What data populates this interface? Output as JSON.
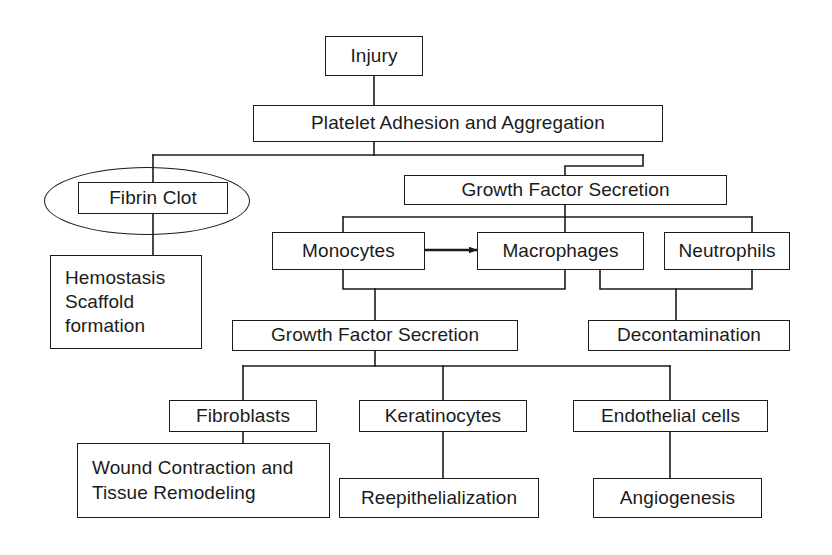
{
  "diagram": {
    "line_color": "#1b1b1b",
    "background": "#ffffff",
    "nodes": {
      "injury": "Injury",
      "platelet": "Platelet Adhesion and Aggregation",
      "fibrin_clot": "Fibrin Clot",
      "hemostasis": "Hemostasis\nScaffold\nformation",
      "growth_factor_1": "Growth Factor Secretion",
      "monocytes": "Monocytes",
      "macrophages": "Macrophages",
      "neutrophils": "Neutrophils",
      "growth_factor_2": "Growth Factor Secretion",
      "decontamination": "Decontamination",
      "fibroblasts": "Fibroblasts",
      "keratinocytes": "Keratinocytes",
      "endothelial": "Endothelial cells",
      "wound_contraction": "Wound Contraction and\nTissue Remodeling",
      "reepithelialization": "Reepithelialization",
      "angiogenesis": "Angiogenesis"
    },
    "highlight": {
      "shape": "ellipse",
      "encircles": "Fibrin Clot"
    },
    "edges": [
      {
        "from": "Injury",
        "to": "Platelet Adhesion and Aggregation",
        "style": "plain"
      },
      {
        "from": "Platelet Adhesion and Aggregation",
        "to": "Fibrin Clot",
        "style": "plain"
      },
      {
        "from": "Platelet Adhesion and Aggregation",
        "to": "Growth Factor Secretion",
        "style": "plain"
      },
      {
        "from": "Fibrin Clot",
        "to": "Hemostasis Scaffold formation",
        "style": "plain"
      },
      {
        "from": "Growth Factor Secretion",
        "to": "Monocytes",
        "style": "plain"
      },
      {
        "from": "Growth Factor Secretion",
        "to": "Macrophages",
        "style": "plain"
      },
      {
        "from": "Growth Factor Secretion",
        "to": "Neutrophils",
        "style": "plain"
      },
      {
        "from": "Monocytes",
        "to": "Macrophages",
        "style": "arrow"
      },
      {
        "from": "Monocytes",
        "to": "Growth Factor Secretion",
        "style": "plain"
      },
      {
        "from": "Macrophages",
        "to": "Growth Factor Secretion",
        "style": "plain"
      },
      {
        "from": "Macrophages",
        "to": "Decontamination",
        "style": "plain"
      },
      {
        "from": "Neutrophils",
        "to": "Decontamination",
        "style": "plain"
      },
      {
        "from": "Growth Factor Secretion",
        "to": "Fibroblasts",
        "style": "plain"
      },
      {
        "from": "Growth Factor Secretion",
        "to": "Keratinocytes",
        "style": "plain"
      },
      {
        "from": "Growth Factor Secretion",
        "to": "Endothelial cells",
        "style": "plain"
      },
      {
        "from": "Fibroblasts",
        "to": "Wound Contraction and Tissue Remodeling",
        "style": "plain"
      },
      {
        "from": "Keratinocytes",
        "to": "Reepithelialization",
        "style": "plain"
      },
      {
        "from": "Endothelial cells",
        "to": "Angiogenesis",
        "style": "plain"
      }
    ]
  }
}
